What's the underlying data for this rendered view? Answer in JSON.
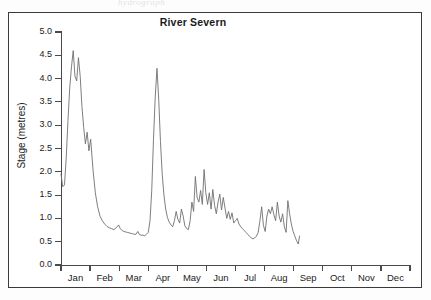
{
  "artifact_text": "hydrograph",
  "frame": {
    "border_color": "#3a3a3a"
  },
  "chart_data": {
    "type": "line",
    "title": "River Severn",
    "xlabel": "",
    "ylabel": "Stage (metres)",
    "ylim": [
      0.0,
      5.0
    ],
    "ytick_values": [
      0.0,
      0.5,
      1.0,
      1.5,
      2.0,
      2.5,
      3.0,
      3.5,
      4.0,
      4.5,
      5.0
    ],
    "ytick_labels": [
      "0.0",
      "0.5",
      "1.0",
      "1.5",
      "2.0",
      "2.5",
      "3.0",
      "3.5",
      "4.0",
      "4.5",
      "5.0"
    ],
    "xtick_labels": [
      "Jan",
      "Feb",
      "Mar",
      "Apr",
      "May",
      "Jun",
      "Jul",
      "Aug",
      "Sep",
      "Oct",
      "Nov",
      "Dec"
    ],
    "grid": false,
    "legend": "none",
    "line_color": "#6f6f6f",
    "series_name": "Stage",
    "units": "metres",
    "x_units": "months (Jan=0 .. Dec=12)",
    "data_end_month": 8.2,
    "note": "Record stops in early September; Sep-Dec have no data",
    "x": [
      0.0,
      0.06,
      0.12,
      0.18,
      0.24,
      0.3,
      0.36,
      0.42,
      0.48,
      0.54,
      0.6,
      0.66,
      0.72,
      0.78,
      0.84,
      0.9,
      0.96,
      1.02,
      1.1,
      1.18,
      1.26,
      1.34,
      1.42,
      1.5,
      1.58,
      1.66,
      1.74,
      1.82,
      1.9,
      1.98,
      2.04,
      2.1,
      2.16,
      2.22,
      2.28,
      2.34,
      2.4,
      2.46,
      2.52,
      2.58,
      2.64,
      2.7,
      2.76,
      2.82,
      2.88,
      2.94,
      3.0,
      3.06,
      3.12,
      3.18,
      3.24,
      3.3,
      3.36,
      3.42,
      3.48,
      3.54,
      3.6,
      3.66,
      3.72,
      3.78,
      3.84,
      3.9,
      3.96,
      4.02,
      4.08,
      4.14,
      4.2,
      4.26,
      4.32,
      4.38,
      4.44,
      4.5,
      4.56,
      4.62,
      4.68,
      4.74,
      4.8,
      4.86,
      4.92,
      4.98,
      5.04,
      5.1,
      5.16,
      5.22,
      5.28,
      5.34,
      5.4,
      5.46,
      5.52,
      5.58,
      5.64,
      5.7,
      5.76,
      5.82,
      5.88,
      5.94,
      6.0,
      6.06,
      6.12,
      6.18,
      6.24,
      6.3,
      6.36,
      6.42,
      6.48,
      6.54,
      6.6,
      6.66,
      6.72,
      6.78,
      6.84,
      6.9,
      6.96,
      7.02,
      7.08,
      7.14,
      7.2,
      7.26,
      7.32,
      7.38,
      7.44,
      7.5,
      7.56,
      7.62,
      7.68,
      7.74,
      7.8,
      7.86,
      7.92,
      7.98,
      8.04,
      8.1,
      8.16,
      8.2
    ],
    "y": [
      1.95,
      1.68,
      1.72,
      2.3,
      3.1,
      3.8,
      4.25,
      4.6,
      4.05,
      3.95,
      4.45,
      4.05,
      3.4,
      2.95,
      2.6,
      2.85,
      2.45,
      2.7,
      2.05,
      1.55,
      1.25,
      1.05,
      0.95,
      0.88,
      0.83,
      0.8,
      0.78,
      0.76,
      0.8,
      0.86,
      0.78,
      0.74,
      0.72,
      0.71,
      0.7,
      0.69,
      0.68,
      0.67,
      0.66,
      0.66,
      0.72,
      0.65,
      0.64,
      0.64,
      0.63,
      0.66,
      0.7,
      0.95,
      1.6,
      2.7,
      3.6,
      4.22,
      3.55,
      2.65,
      1.95,
      1.5,
      1.2,
      1.02,
      0.92,
      0.86,
      0.82,
      0.95,
      1.15,
      0.98,
      0.9,
      1.2,
      1.05,
      0.84,
      0.78,
      0.76,
      0.95,
      1.35,
      1.15,
      1.9,
      1.45,
      1.35,
      1.6,
      1.3,
      2.05,
      1.55,
      1.3,
      1.55,
      1.2,
      1.62,
      1.28,
      1.1,
      1.35,
      1.52,
      1.18,
      1.45,
      1.22,
      1.0,
      1.15,
      0.98,
      1.12,
      0.9,
      0.95,
      1.0,
      0.88,
      0.82,
      0.78,
      0.74,
      0.7,
      0.66,
      0.62,
      0.58,
      0.56,
      0.58,
      0.62,
      0.7,
      0.95,
      1.25,
      0.85,
      0.72,
      1.05,
      1.2,
      1.1,
      1.25,
      1.08,
      0.95,
      1.35,
      1.05,
      0.92,
      1.1,
      0.82,
      0.7,
      1.38,
      1.1,
      0.88,
      0.72,
      0.62,
      0.52,
      0.45,
      0.62
    ]
  },
  "secondary_series": {
    "x": [
      6.96,
      7.02,
      7.08,
      7.14,
      7.2,
      7.26,
      7.32,
      7.38,
      7.44,
      7.5,
      7.56,
      7.62,
      7.68,
      7.74,
      7.8,
      7.86,
      7.92,
      7.98,
      8.04,
      8.1,
      8.16,
      8.2
    ],
    "y": [
      0.62,
      0.85,
      0.78,
      0.72,
      0.95,
      0.88,
      0.82,
      1.0,
      0.92,
      0.8,
      0.95,
      1.05,
      0.88,
      0.78,
      0.7,
      0.62,
      0.58,
      0.72,
      1.15,
      0.85,
      0.65,
      0.8
    ]
  }
}
